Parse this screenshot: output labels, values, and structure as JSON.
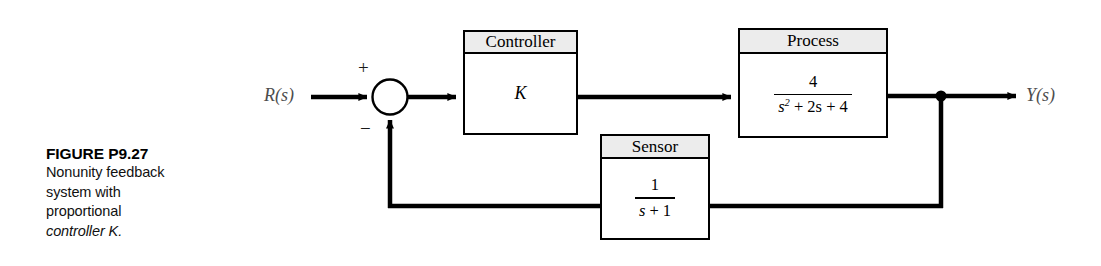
{
  "caption": {
    "figure_number": "FIGURE P9.27",
    "description_lines": [
      "Nonunity feedback",
      "system with",
      "proportional",
      "controller K."
    ],
    "italic_token": "K"
  },
  "diagram": {
    "type": "control-system-block-diagram",
    "input_signal": "R(s)",
    "output_signal": "Y(s)",
    "summing_junction": {
      "positive_sign": "+",
      "negative_sign": "−"
    },
    "blocks": [
      {
        "id": "controller",
        "title": "Controller",
        "body_kind": "gain",
        "gain": "K",
        "transfer_function": "K"
      },
      {
        "id": "process",
        "title": "Process",
        "body_kind": "fraction",
        "numerator": "4",
        "denominator_parts": {
          "var": "s",
          "exponent": "2",
          "rest": "+ 2s + 4"
        },
        "denominator": "s² + 2s + 4",
        "transfer_function": "4/(s^2 + 2s + 4)"
      },
      {
        "id": "sensor",
        "title": "Sensor",
        "body_kind": "fraction",
        "numerator": "1",
        "denominator_parts": {
          "var": "s",
          "exponent": "",
          "rest": "+ 1"
        },
        "denominator": "s + 1",
        "transfer_function": "1/(s + 1)"
      }
    ],
    "colors": {
      "line": "#000000",
      "block_header_fill": "#ececec",
      "block_body_fill": "#ffffff",
      "signal_label": "#4d4d4d"
    }
  }
}
